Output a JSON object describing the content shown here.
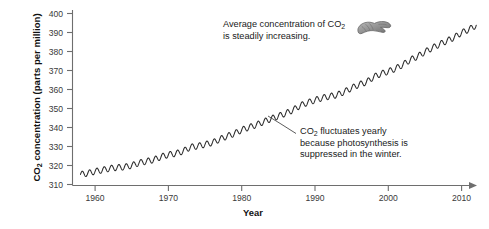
{
  "chart_data": {
    "type": "line",
    "title": "",
    "xlabel": "Year",
    "ylabel": "CO2 concentration (parts per million)",
    "ylabel_parts": {
      "pre": "CO",
      "sub": "2",
      "post": " concentration (parts per million)"
    },
    "xlim": [
      1957,
      2012
    ],
    "ylim": [
      310,
      400
    ],
    "xticks": [
      "1960",
      "1970",
      "1980",
      "1990",
      "2000",
      "2010"
    ],
    "xtick_values": [
      1960,
      1970,
      1980,
      1990,
      2000,
      2010
    ],
    "yticks": [
      "310",
      "320",
      "330",
      "340",
      "350",
      "360",
      "370",
      "380",
      "390",
      "400"
    ],
    "ytick_values": [
      310,
      320,
      330,
      340,
      350,
      360,
      370,
      380,
      390,
      400
    ],
    "grid": false,
    "legend": false,
    "series": [
      {
        "name": "Mauna Loa monthly mean CO2",
        "description": "Annual mean trend with seasonal oscillation of about 3 ppm peak-to-peak",
        "x": [
          1958,
          1959,
          1960,
          1961,
          1962,
          1963,
          1964,
          1965,
          1966,
          1967,
          1968,
          1969,
          1970,
          1971,
          1972,
          1973,
          1974,
          1975,
          1976,
          1977,
          1978,
          1979,
          1980,
          1981,
          1982,
          1983,
          1984,
          1985,
          1986,
          1987,
          1988,
          1989,
          1990,
          1991,
          1992,
          1993,
          1994,
          1995,
          1996,
          1997,
          1998,
          1999,
          2000,
          2001,
          2002,
          2003,
          2004,
          2005,
          2006,
          2007,
          2008,
          2009,
          2010,
          2011,
          2012
        ],
        "values": [
          315.3,
          315.9,
          316.9,
          317.6,
          318.5,
          318.9,
          319.2,
          320.0,
          321.4,
          322.2,
          323.0,
          324.6,
          325.7,
          326.3,
          327.5,
          329.7,
          330.2,
          331.1,
          332.0,
          333.8,
          335.4,
          336.8,
          338.7,
          340.1,
          341.4,
          343.0,
          344.6,
          346.0,
          347.4,
          349.2,
          351.6,
          353.1,
          354.4,
          355.6,
          356.4,
          357.1,
          358.8,
          360.8,
          362.6,
          363.8,
          366.6,
          368.3,
          369.5,
          371.0,
          373.1,
          375.6,
          377.4,
          379.8,
          381.9,
          383.8,
          385.6,
          387.4,
          389.9,
          391.6,
          393.8
        ]
      }
    ],
    "annotations": [
      {
        "id": "annot-top",
        "lines": [
          {
            "pre": "Average concentration of CO",
            "sub": "2",
            "post": ""
          },
          {
            "pre": "is steadily increasing.",
            "sub": "",
            "post": ""
          }
        ]
      },
      {
        "id": "annot-bottom",
        "lines": [
          {
            "pre": "CO",
            "sub": "2",
            "post": " fluctuates yearly"
          },
          {
            "pre": "because photosynthesis is",
            "sub": "",
            "post": ""
          },
          {
            "pre": "suppressed in the winter.",
            "sub": "",
            "post": ""
          }
        ]
      }
    ],
    "icons": [
      {
        "name": "pointing-hand-icon",
        "description": "Gray drawn hand with extended index finger pointing right toward the rising curve"
      }
    ],
    "colors": {
      "line": "#2b2b2b",
      "axis": "#6e6e6e",
      "text": "#1a1a1a",
      "background": "#ffffff",
      "hand": "#8c8c8c"
    }
  }
}
